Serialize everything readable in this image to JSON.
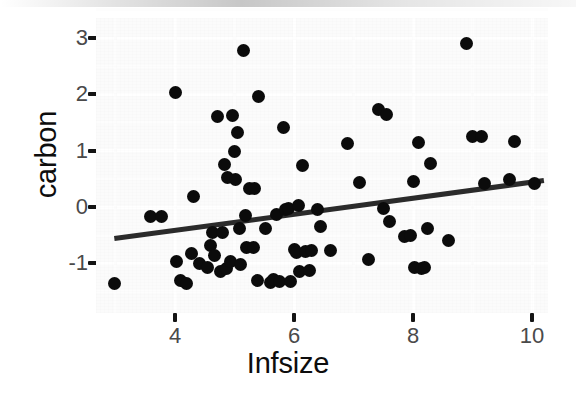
{
  "chart_data": {
    "type": "scatter",
    "title": "",
    "xlabel": "Infsize",
    "ylabel": "carbon",
    "xlim": [
      2.7,
      10.3
    ],
    "ylim": [
      -1.55,
      3.25
    ],
    "xticks": [
      4,
      6,
      8,
      10
    ],
    "xtick_labels": [
      "4",
      "6",
      "8",
      "10"
    ],
    "yticks": [
      3,
      2,
      1,
      0,
      -1
    ],
    "ytick_labels": [
      "3",
      "2",
      "1",
      "0",
      "-1"
    ],
    "grid": true,
    "legend": "none",
    "point_color": "#0b0b0b",
    "panel_color": "#fbfbfb",
    "gridline_color": "#ffffff",
    "fit_line": {
      "type": "linear-regression",
      "color": "#2b2b2b",
      "width_px": 5,
      "x_start": 2.98,
      "y_start": -0.56,
      "x_end": 10.2,
      "y_end": 0.47
    },
    "points": [
      {
        "x": 2.98,
        "y": -1.36
      },
      {
        "x": 3.58,
        "y": -0.17
      },
      {
        "x": 3.78,
        "y": -0.16
      },
      {
        "x": 4.0,
        "y": 2.03
      },
      {
        "x": 4.03,
        "y": -0.96
      },
      {
        "x": 4.1,
        "y": -1.3
      },
      {
        "x": 4.2,
        "y": -1.36
      },
      {
        "x": 4.27,
        "y": -0.83
      },
      {
        "x": 4.31,
        "y": 0.19
      },
      {
        "x": 4.41,
        "y": -1.01
      },
      {
        "x": 4.55,
        "y": -1.07
      },
      {
        "x": 4.6,
        "y": -0.68
      },
      {
        "x": 4.63,
        "y": -0.46
      },
      {
        "x": 4.66,
        "y": -0.86
      },
      {
        "x": 4.72,
        "y": 1.6
      },
      {
        "x": 4.77,
        "y": -1.14
      },
      {
        "x": 4.79,
        "y": -0.45
      },
      {
        "x": 4.84,
        "y": 0.75
      },
      {
        "x": 4.86,
        "y": -1.09
      },
      {
        "x": 4.88,
        "y": 0.53
      },
      {
        "x": 4.93,
        "y": -0.97
      },
      {
        "x": 4.96,
        "y": 1.62
      },
      {
        "x": 5.0,
        "y": 0.99
      },
      {
        "x": 5.02,
        "y": 0.48
      },
      {
        "x": 5.05,
        "y": 1.33
      },
      {
        "x": 5.08,
        "y": -0.38
      },
      {
        "x": 5.1,
        "y": -1.02
      },
      {
        "x": 5.15,
        "y": 2.78
      },
      {
        "x": 5.18,
        "y": -0.15
      },
      {
        "x": 5.2,
        "y": -0.72
      },
      {
        "x": 5.25,
        "y": 0.32
      },
      {
        "x": 5.32,
        "y": -0.72
      },
      {
        "x": 5.34,
        "y": 0.33
      },
      {
        "x": 5.38,
        "y": -1.31
      },
      {
        "x": 5.4,
        "y": 1.96
      },
      {
        "x": 5.52,
        "y": -0.39
      },
      {
        "x": 5.6,
        "y": -1.34
      },
      {
        "x": 5.66,
        "y": -1.28
      },
      {
        "x": 5.7,
        "y": -0.13
      },
      {
        "x": 5.75,
        "y": -1.32
      },
      {
        "x": 5.83,
        "y": 1.42
      },
      {
        "x": 5.86,
        "y": -0.05
      },
      {
        "x": 5.9,
        "y": -0.02
      },
      {
        "x": 5.94,
        "y": -1.33
      },
      {
        "x": 6.0,
        "y": -0.76
      },
      {
        "x": 6.05,
        "y": -0.81
      },
      {
        "x": 6.08,
        "y": 0.02
      },
      {
        "x": 6.1,
        "y": -1.14
      },
      {
        "x": 6.14,
        "y": 0.74
      },
      {
        "x": 6.2,
        "y": -0.79
      },
      {
        "x": 6.26,
        "y": -1.12
      },
      {
        "x": 6.3,
        "y": -0.78
      },
      {
        "x": 6.4,
        "y": -0.05
      },
      {
        "x": 6.45,
        "y": -0.35
      },
      {
        "x": 6.62,
        "y": -0.78
      },
      {
        "x": 6.9,
        "y": 1.12
      },
      {
        "x": 7.1,
        "y": 0.43
      },
      {
        "x": 7.25,
        "y": -0.93
      },
      {
        "x": 7.42,
        "y": 1.74
      },
      {
        "x": 7.5,
        "y": -0.02
      },
      {
        "x": 7.55,
        "y": 1.65
      },
      {
        "x": 7.6,
        "y": -0.25
      },
      {
        "x": 7.85,
        "y": -0.52
      },
      {
        "x": 7.95,
        "y": -0.5
      },
      {
        "x": 8.0,
        "y": 0.45
      },
      {
        "x": 8.02,
        "y": -1.08
      },
      {
        "x": 8.1,
        "y": 1.14
      },
      {
        "x": 8.14,
        "y": -1.09
      },
      {
        "x": 8.2,
        "y": -1.07
      },
      {
        "x": 8.24,
        "y": -0.38
      },
      {
        "x": 8.3,
        "y": 0.78
      },
      {
        "x": 8.6,
        "y": -0.6
      },
      {
        "x": 8.9,
        "y": 2.9
      },
      {
        "x": 9.0,
        "y": 1.25
      },
      {
        "x": 9.15,
        "y": 1.25
      },
      {
        "x": 9.2,
        "y": 0.42
      },
      {
        "x": 9.62,
        "y": 0.49
      },
      {
        "x": 9.7,
        "y": 1.17
      },
      {
        "x": 10.05,
        "y": 0.41
      }
    ]
  }
}
